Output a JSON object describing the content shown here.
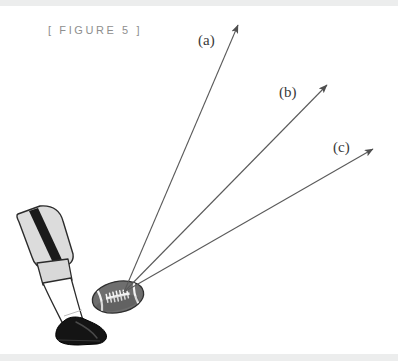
{
  "figure": {
    "caption": "[ FIGURE 5 ]",
    "caption_color": "#8e8e8e",
    "background_color": "#ffffff",
    "band_color": "#eceded"
  },
  "illustration": {
    "subject": "kicking-leg-and-football",
    "ball": {
      "name": "football",
      "fill_color": "#6e6e6e",
      "outline_color": "#2f2f2f",
      "lace_color": "#f2f2f2",
      "center_x": 118,
      "center_y": 297,
      "rx": 26,
      "ry": 16,
      "rotation_deg": -12
    },
    "leg": {
      "pant_color": "#dcdcdc",
      "pant_stripe_color": "#1a1a1a",
      "knee_band_color": "#d8d8d8",
      "sock_color": "#ffffff",
      "shoe_color": "#141414",
      "outline_color": "#2b2b2b"
    }
  },
  "vectors": {
    "origin": {
      "x": 124,
      "y": 292
    },
    "line_color": "#5a5a5a",
    "line_width": 1,
    "items": [
      {
        "id": "a",
        "label": "(a)",
        "tip_x": 240,
        "tip_y": 22,
        "label_x": 198,
        "label_y": 32,
        "description": "high-trajectory kick"
      },
      {
        "id": "b",
        "label": "(b)",
        "tip_x": 330,
        "tip_y": 82,
        "label_x": 279,
        "label_y": 84,
        "description": "medium-trajectory kick"
      },
      {
        "id": "c",
        "label": "(c)",
        "tip_x": 376,
        "tip_y": 146,
        "label_x": 333,
        "label_y": 139,
        "description": "low-trajectory kick"
      }
    ]
  }
}
